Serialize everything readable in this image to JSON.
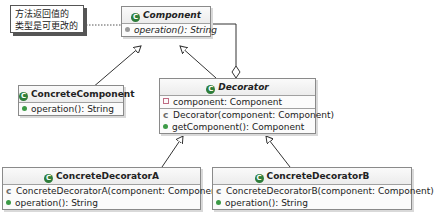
{
  "note": {
    "line1": "方法返回值的",
    "line2": "类型是可更改的"
  },
  "classes": {
    "component": {
      "name": "Component",
      "icon": "abstract-class-icon",
      "methods": [
        {
          "text": "operation(): String",
          "icon": "abstract-method-icon"
        }
      ]
    },
    "concrete_component": {
      "name": "ConcreteComponent",
      "icon": "class-icon",
      "methods": [
        {
          "text": "operation(): String",
          "icon": "public-method-icon"
        }
      ]
    },
    "decorator": {
      "name": "Decorator",
      "icon": "abstract-class-icon",
      "fields": [
        {
          "text": "component: Component",
          "icon": "private-field-icon"
        }
      ],
      "methods": [
        {
          "text": "Decorator(component: Component)",
          "icon": "constructor-icon"
        },
        {
          "text": "getComponent(): Component",
          "icon": "public-method-icon"
        }
      ]
    },
    "concrete_decorator_a": {
      "name": "ConcreteDecoratorA",
      "icon": "class-icon",
      "methods": [
        {
          "text": "ConcreteDecoratorA(component: Component)",
          "icon": "constructor-icon"
        },
        {
          "text": "operation(): String",
          "icon": "public-method-icon"
        }
      ]
    },
    "concrete_decorator_b": {
      "name": "ConcreteDecoratorB",
      "icon": "class-icon",
      "methods": [
        {
          "text": "ConcreteDecoratorB(component: Component)",
          "icon": "constructor-icon"
        },
        {
          "text": "operation(): String",
          "icon": "public-method-icon"
        }
      ]
    }
  },
  "relations": [
    {
      "from": "ConcreteComponent",
      "to": "Component",
      "type": "generalization"
    },
    {
      "from": "Decorator",
      "to": "Component",
      "type": "generalization"
    },
    {
      "from": "Decorator",
      "to": "Component",
      "type": "aggregation"
    },
    {
      "from": "ConcreteDecoratorA",
      "to": "Decorator",
      "type": "generalization"
    },
    {
      "from": "ConcreteDecoratorB",
      "to": "Decorator",
      "type": "generalization"
    },
    {
      "from": "note",
      "to": "Component",
      "type": "note-link"
    }
  ],
  "icon_glyphs": {
    "class": "C",
    "constructor": "c"
  }
}
